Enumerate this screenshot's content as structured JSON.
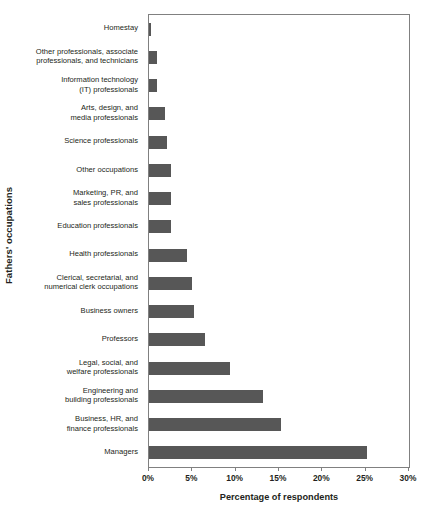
{
  "chart_data": {
    "type": "bar",
    "orientation": "horizontal",
    "title": "",
    "xlabel": "Percentage of respondents",
    "ylabel": "Fathers' occupations",
    "xlim": [
      0,
      30
    ],
    "xtick_labels": [
      "0%",
      "5%",
      "10%",
      "15%",
      "20%",
      "25%",
      "30%"
    ],
    "xticks": [
      0,
      5,
      10,
      15,
      20,
      25,
      30
    ],
    "grid": false,
    "legend": "none",
    "bar_color": "#575757",
    "axis_color": "#808080",
    "categories": [
      "Homestay",
      "Other professionals, associate professionals, and technicians",
      "Information technology (IT) professionals",
      "Arts, design, and media professionals",
      "Science professionals",
      "Other occupations",
      "Marketing, PR, and sales professionals",
      "Education professionals",
      "Health professionals",
      "Clerical, secretarial, and numerical clerk occupations",
      "Business owners",
      "Professors",
      "Legal, social, and welfare professionals",
      "Engineering and building professionals",
      "Business, HR, and finance professionals",
      "Managers"
    ],
    "values": [
      0.2,
      0.9,
      0.9,
      1.9,
      2.1,
      2.5,
      2.5,
      2.5,
      4.4,
      5.0,
      5.2,
      6.5,
      9.3,
      13.2,
      15.2,
      25.1
    ]
  },
  "category_label_lines": [
    [
      "Homestay"
    ],
    [
      "Other professionals, associate",
      "professionals, and technicians"
    ],
    [
      "Information technology",
      "(IT) professionals"
    ],
    [
      "Arts, design, and",
      "media professionals"
    ],
    [
      "Science professionals"
    ],
    [
      "Other occupations"
    ],
    [
      "Marketing, PR, and",
      "sales professionals"
    ],
    [
      "Education professionals"
    ],
    [
      "Health professionals"
    ],
    [
      "Clerical, secretarial, and",
      "numerical clerk occupations"
    ],
    [
      "Business owners"
    ],
    [
      "Professors"
    ],
    [
      "Legal, social, and",
      "welfare professionals"
    ],
    [
      "Engineering and",
      "building professionals"
    ],
    [
      "Business, HR, and",
      "finance professionals"
    ],
    [
      "Managers"
    ]
  ]
}
